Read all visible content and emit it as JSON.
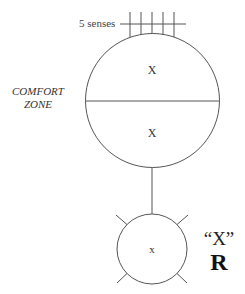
{
  "diagram": {
    "senses_label": "5 senses",
    "comfort_zone": {
      "line1": "COMFORT",
      "line2": "ZONE"
    },
    "big_circle": {
      "upper_half_label": "X",
      "lower_half_label": "X"
    },
    "small_circle": {
      "label": "x"
    },
    "side_label": {
      "quoted": "“X”",
      "letter": "R"
    },
    "colors": {
      "stroke": "#555555",
      "text": "#333333",
      "background": "#ffffff"
    }
  }
}
